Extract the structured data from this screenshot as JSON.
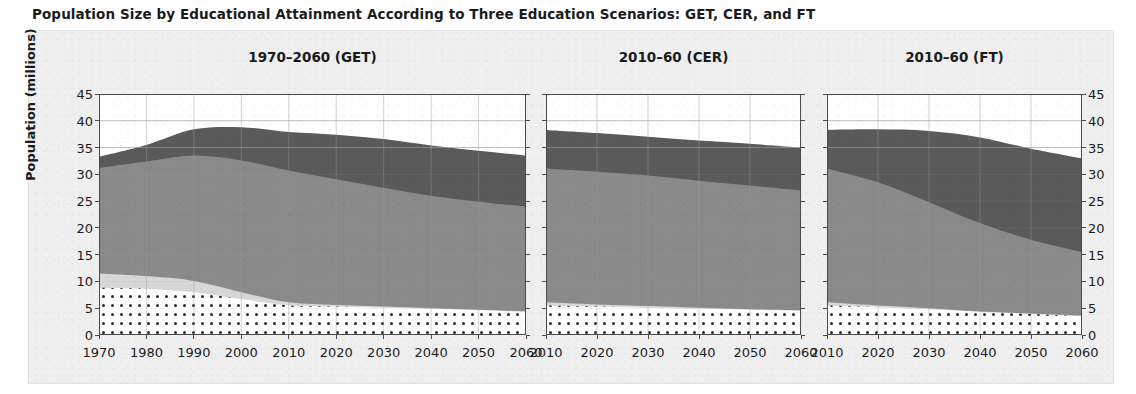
{
  "figure": {
    "title": "Population Size by Educational Attainment According to Three Education Scenarios: GET, CER, and FT"
  },
  "axes": {
    "ylabel": "Population (millions)",
    "yticks": [
      "45",
      "40",
      "35",
      "30",
      "25",
      "20",
      "15",
      "10",
      "5",
      "0"
    ],
    "ylim": [
      0,
      45
    ]
  },
  "panels": [
    {
      "title": "1970–2060 (GET)",
      "xticks": [
        "1970",
        "1980",
        "1990",
        "2000",
        "2010",
        "2020",
        "2030",
        "2040",
        "2050",
        "2060"
      ]
    },
    {
      "title": "2010–60 (CER)",
      "xticks": [
        "2010",
        "2020",
        "2030",
        "2040",
        "2050",
        "2060"
      ]
    },
    {
      "title": "2010–60 (FT)",
      "xticks": [
        "2010",
        "2020",
        "2030",
        "2040",
        "2050",
        "2060"
      ]
    }
  ],
  "colors": {
    "no_education": "#ffffff",
    "primary": "#d7d7d7",
    "secondary": "#8a8a8a",
    "tertiary": "#5a5a5a",
    "axis": "#4a4a4a",
    "grid": "#9a9a9a",
    "text": "#1b1b1b",
    "figure_background": "#efefef"
  },
  "chart_data": {
    "type": "area",
    "title": "Population Size by Educational Attainment According to Three Education Scenarios: GET, CER, and FT",
    "xlabel": "",
    "ylabel": "Population (millions)",
    "ylim": [
      0,
      45
    ],
    "grid": true,
    "legend": "none",
    "stacked": true,
    "stack_order_bottom_to_top": [
      "No education",
      "Primary",
      "Secondary",
      "Tertiary"
    ],
    "panels": [
      {
        "name": "1970–2060 (GET)",
        "xlim": [
          1970,
          2060
        ],
        "x": [
          1970,
          1980,
          1990,
          2000,
          2010,
          2020,
          2030,
          2040,
          2050,
          2060
        ],
        "series": [
          {
            "name": "No education",
            "values": [
              8.8,
              8.6,
              8.0,
              6.7,
              5.5,
              5.3,
              5.1,
              4.9,
              4.6,
              4.3
            ]
          },
          {
            "name": "Primary",
            "values": [
              2.7,
              2.4,
              2.1,
              1.3,
              0.6,
              0.3,
              0.2,
              0.1,
              0.1,
              0.1
            ]
          },
          {
            "name": "Secondary",
            "values": [
              19.7,
              21.4,
              23.4,
              24.6,
              24.6,
              23.5,
              22.2,
              21.0,
              20.2,
              19.6
            ]
          },
          {
            "name": "Tertiary",
            "values": [
              2.1,
              3.1,
              4.9,
              6.2,
              7.2,
              8.3,
              9.1,
              9.4,
              9.5,
              9.5
            ]
          }
        ],
        "totals": [
          33.3,
          35.5,
          38.4,
          38.8,
          37.9,
          37.4,
          36.6,
          35.4,
          34.4,
          33.5
        ]
      },
      {
        "name": "2010–60 (CER)",
        "xlim": [
          2010,
          2060
        ],
        "x": [
          2010,
          2020,
          2030,
          2040,
          2050,
          2060
        ],
        "series": [
          {
            "name": "No education",
            "values": [
              5.5,
              5.3,
              5.1,
              4.9,
              4.7,
              4.5
            ]
          },
          {
            "name": "Primary",
            "values": [
              0.6,
              0.4,
              0.3,
              0.2,
              0.1,
              0.1
            ]
          },
          {
            "name": "Secondary",
            "values": [
              25.0,
              24.8,
              24.4,
              23.7,
              23.1,
              22.4
            ]
          },
          {
            "name": "Tertiary",
            "values": [
              7.2,
              7.2,
              7.2,
              7.5,
              7.8,
              8.0
            ]
          }
        ],
        "totals": [
          38.3,
          37.7,
          37.0,
          36.3,
          35.7,
          35.0
        ]
      },
      {
        "name": "2010–60 (FT)",
        "xlim": [
          2010,
          2060
        ],
        "x": [
          2010,
          2020,
          2030,
          2040,
          2050,
          2060
        ],
        "series": [
          {
            "name": "No education",
            "values": [
              5.5,
              5.2,
              4.8,
              4.3,
              3.9,
              3.5
            ]
          },
          {
            "name": "Primary",
            "values": [
              0.6,
              0.3,
              0.2,
              0.1,
              0.1,
              0.1
            ]
          },
          {
            "name": "Secondary",
            "values": [
              25.0,
              23.0,
              19.8,
              16.5,
              13.8,
              11.9
            ]
          },
          {
            "name": "Tertiary",
            "values": [
              7.2,
              9.9,
              13.3,
              16.0,
              17.0,
              17.5
            ]
          }
        ],
        "totals": [
          38.3,
          38.4,
          38.1,
          36.9,
          34.8,
          33.0
        ]
      }
    ]
  }
}
